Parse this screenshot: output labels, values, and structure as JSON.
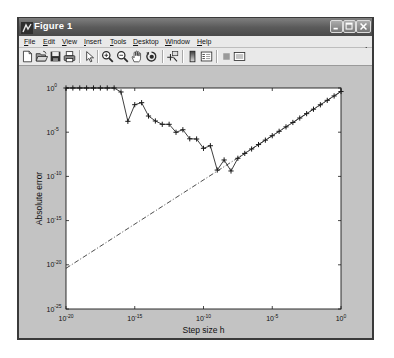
{
  "window": {
    "title": "Figure 1",
    "icon": "matlab-figure-icon",
    "controls": [
      "minimize-icon",
      "maximize-icon",
      "close-icon"
    ]
  },
  "menu": {
    "items": [
      {
        "label": "File"
      },
      {
        "label": "Edit"
      },
      {
        "label": "View"
      },
      {
        "label": "Insert"
      },
      {
        "label": "Tools"
      },
      {
        "label": "Desktop"
      },
      {
        "label": "Window"
      },
      {
        "label": "Help"
      }
    ],
    "dock_icon": "dock-arrow-icon"
  },
  "toolbar": {
    "items": [
      {
        "icon": "new-figure-icon"
      },
      {
        "icon": "open-file-icon"
      },
      {
        "icon": "save-icon"
      },
      {
        "icon": "print-icon"
      },
      {
        "icon": "edit-plot-arrow-icon"
      },
      {
        "icon": "zoom-in-icon"
      },
      {
        "icon": "zoom-out-icon"
      },
      {
        "icon": "pan-hand-icon"
      },
      {
        "icon": "rotate-3d-icon"
      },
      {
        "icon": "data-cursor-icon"
      },
      {
        "icon": "insert-colorbar-icon"
      },
      {
        "icon": "insert-legend-icon"
      },
      {
        "icon": "hide-plot-tools-icon"
      },
      {
        "icon": "show-plot-tools-icon"
      }
    ]
  },
  "colors": {
    "titlebar": "#5a5a5a",
    "menubar": "#e9e9e9",
    "figure_background": "#c3c3c3",
    "axes_background": "#ffffff",
    "line": "#2a2a2a"
  },
  "chart_data": {
    "type": "line",
    "title": "",
    "xlabel": "Step size h",
    "ylabel": "Absolute error",
    "xscale": "log",
    "yscale": "log",
    "xlim": [
      1e-20,
      1
    ],
    "ylim": [
      1e-25,
      1
    ],
    "grid": false,
    "legend": null,
    "xticks": [
      1e-20,
      1e-15,
      1e-10,
      1e-05,
      1
    ],
    "xtick_labels": [
      {
        "base": "10",
        "exp": "-20"
      },
      {
        "base": "10",
        "exp": "-15"
      },
      {
        "base": "10",
        "exp": "-10"
      },
      {
        "base": "10",
        "exp": "-5"
      },
      {
        "base": "10",
        "exp": "0"
      }
    ],
    "yticks": [
      1,
      1e-05,
      1e-10,
      1e-15,
      1e-20,
      1e-25
    ],
    "ytick_labels": [
      {
        "base": "10",
        "exp": "0"
      },
      {
        "base": "10",
        "exp": "-5"
      },
      {
        "base": "10",
        "exp": "-10"
      },
      {
        "base": "10",
        "exp": "-15"
      },
      {
        "base": "10",
        "exp": "-20"
      },
      {
        "base": "10",
        "exp": "-25"
      }
    ],
    "series": [
      {
        "line": "solid",
        "marker": "+",
        "x": [
          1e-20,
          3.16e-20,
          1e-19,
          3.16e-19,
          1e-18,
          3.16e-18,
          1e-17,
          3.16e-17,
          1e-16,
          3.16e-16,
          1e-15,
          3.16e-15,
          1e-14,
          3.16e-14,
          1e-13,
          3.16e-13,
          1e-12,
          3.16e-12,
          1e-11,
          3.16e-11,
          1e-10,
          3.16e-10,
          1e-09,
          3.16e-09,
          1e-08,
          3.16e-08,
          1e-07,
          3.16e-07,
          1e-06,
          3.16e-06,
          1e-05,
          3.16e-05,
          0.0001,
          0.000316,
          0.001,
          0.00316,
          0.01,
          0.0316,
          0.1,
          0.316,
          1
        ],
        "y": [
          1,
          1,
          1,
          1,
          1,
          1,
          1,
          1,
          0.355,
          0.00017,
          0.0129,
          0.0219,
          0.00068,
          0.000186,
          7.8e-05,
          7.8e-05,
          9.8e-06,
          1.9e-05,
          1.8e-06,
          1.7e-06,
          1.5e-07,
          2.95e-07,
          5.2e-10,
          7.2e-09,
          4.1e-10,
          1.12e-08,
          4e-08,
          1.26e-07,
          4e-07,
          1.26e-06,
          4e-06,
          1.26e-05,
          4e-05,
          0.000126,
          0.0004,
          0.00126,
          0.004,
          0.0126,
          0.04,
          0.126,
          0.4
        ]
      },
      {
        "line": "dash-dot",
        "marker": "none",
        "x": [
          1e-20,
          1
        ],
        "y": [
          4e-21,
          0.4
        ]
      }
    ]
  }
}
